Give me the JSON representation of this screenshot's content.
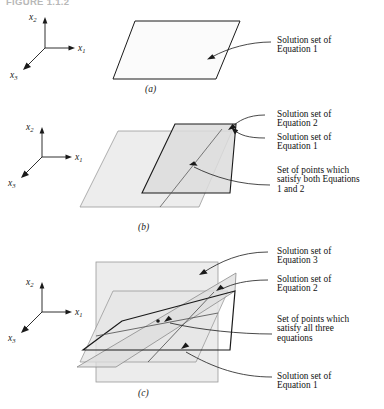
{
  "figure": {
    "title": "FIGURE 1.1.2",
    "axes": {
      "x1": "x",
      "x1_sub": "1",
      "x2": "x",
      "x2_sub": "2",
      "x3": "x",
      "x3_sub": "3"
    }
  },
  "panels": [
    {
      "id": "a",
      "label": "(a)",
      "callouts": [
        {
          "id": "a-eq1",
          "text": "Solution set of\nEquation 1"
        }
      ]
    },
    {
      "id": "b",
      "label": "(b)",
      "callouts": [
        {
          "id": "b-eq2",
          "text": "Solution set of\nEquation 2"
        },
        {
          "id": "b-eq1",
          "text": "Solution set of\nEquation 1"
        },
        {
          "id": "b-both",
          "text": "Set of points which\nsatisfy both Equations\n1 and 2"
        }
      ]
    },
    {
      "id": "c",
      "label": "(c)",
      "callouts": [
        {
          "id": "c-eq3",
          "text": "Solution set of\nEquation 3"
        },
        {
          "id": "c-eq2",
          "text": "Solution set of\nEquation 2"
        },
        {
          "id": "c-all",
          "text": "Set of points which\nsatisfy all three\nequations"
        },
        {
          "id": "c-eq1",
          "text": "Solution set of\nEquation 1"
        }
      ]
    }
  ],
  "colors": {
    "stroke_dark": "#1a1a1a",
    "stroke_light": "#8a8a8a",
    "plane_fill_light": "#efefef",
    "plane_fill_mid": "#e2e2e2",
    "plane_fill_dark": "#d2d2d2",
    "title_gray": "#b8b8b8"
  }
}
